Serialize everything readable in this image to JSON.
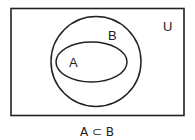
{
  "diagram": {
    "type": "venn",
    "universe_label": "U",
    "sets": [
      {
        "name": "B",
        "label": "B"
      },
      {
        "name": "A",
        "label": "A",
        "subset_of": "B"
      }
    ],
    "caption": "A ⊂ B"
  }
}
